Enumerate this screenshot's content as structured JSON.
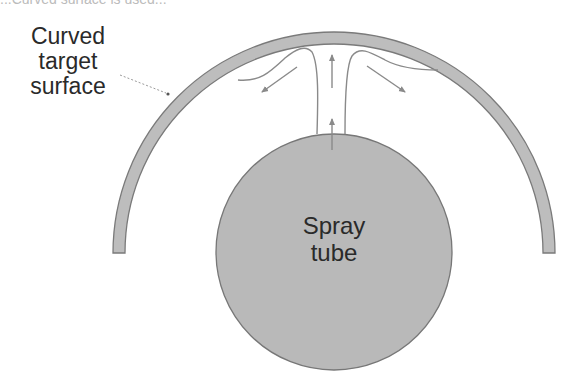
{
  "diagram": {
    "top_caption_cropped": "...Curved surface is used...",
    "labels": {
      "target_surface": [
        "Curved",
        "target",
        "surface"
      ],
      "spray_tube": [
        "Spray",
        "tube"
      ]
    },
    "colors": {
      "fill_gray": "#b9b9b9",
      "stroke_gray": "#7a7a7a",
      "arrow_gray": "#8a8a8a",
      "text": "#2a2a2a"
    }
  }
}
